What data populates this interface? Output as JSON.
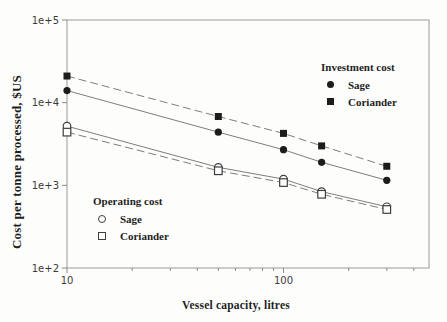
{
  "colors": {
    "ink": "#1c1c1c",
    "line_gray": "#7d7d7d",
    "frame_gray": "#9a9a9a",
    "tick_gray": "#8a8a8a",
    "tick_label": "#3a3a3a",
    "open_marker_stroke": "#3f3f3f",
    "background": "#fdfdfc"
  },
  "chart_data": {
    "type": "line",
    "title": "",
    "xlabel": "Vessel capacity, litres",
    "ylabel": "Cost per tonne processed, $US",
    "xscale": "log",
    "yscale": "log",
    "xlim": [
      10,
      470
    ],
    "ylim": [
      100,
      100000
    ],
    "grid": false,
    "x": [
      10,
      50,
      100,
      150,
      300
    ],
    "series": [
      {
        "name": "Investment cost - Sage",
        "marker": "filled-circle",
        "line": "solid",
        "values": [
          14000,
          4400,
          2700,
          1900,
          1150
        ]
      },
      {
        "name": "Investment cost - Coriander",
        "marker": "filled-square",
        "line": "dashed",
        "values": [
          21000,
          6800,
          4250,
          3000,
          1700
        ]
      },
      {
        "name": "Operating cost - Sage",
        "marker": "open-circle",
        "line": "solid",
        "values": [
          5200,
          1650,
          1190,
          840,
          550
        ]
      },
      {
        "name": "Operating cost - Coriander",
        "marker": "open-square",
        "line": "dashed",
        "values": [
          4400,
          1500,
          1080,
          780,
          510
        ]
      }
    ],
    "x_ticks": [
      {
        "value": 10,
        "label": "10"
      },
      {
        "value": 100,
        "label": "100"
      }
    ],
    "x_minor_ticks": [
      20,
      30,
      40,
      50,
      60,
      70,
      80,
      90,
      200,
      300,
      400
    ],
    "y_ticks": [
      {
        "value": 100000,
        "label": "1e+5"
      },
      {
        "value": 10000,
        "label": "1e+4"
      },
      {
        "value": 1000,
        "label": "1e+3"
      },
      {
        "value": 100,
        "label": "1e+2"
      }
    ],
    "legends": [
      {
        "title": "Investment cost",
        "position": "top-right",
        "items": [
          {
            "label": "Sage",
            "marker": "filled-circle"
          },
          {
            "label": "Coriander",
            "marker": "filled-square"
          }
        ]
      },
      {
        "title": "Operating cost",
        "position": "bottom-left",
        "items": [
          {
            "label": "Sage",
            "marker": "open-circle"
          },
          {
            "label": "Coriander",
            "marker": "open-square"
          }
        ]
      }
    ]
  }
}
